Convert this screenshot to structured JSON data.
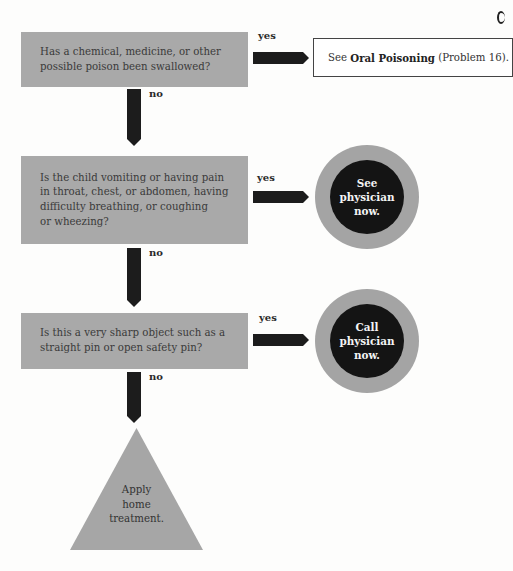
{
  "flowchart": {
    "questions": [
      {
        "lines": [
          "Has a chemical, medicine, or other",
          "possible poison been swallowed?"
        ],
        "yes_label": "yes",
        "no_label": "no"
      },
      {
        "lines": [
          "Is the child vomiting or having pain",
          "in throat, chest, or abdomen, having",
          "difficulty breathing, or coughing",
          "or wheezing?"
        ],
        "yes_label": "yes",
        "no_label": "no"
      },
      {
        "lines": [
          "Is this a very sharp object such as a",
          "straight pin or open safety pin?"
        ],
        "yes_label": "yes",
        "no_label": "no"
      }
    ],
    "outcomes": {
      "referral": {
        "prefix": "See ",
        "bold": "Oral Poisoning",
        "suffix": " (Problem 16)."
      },
      "see_physician": [
        "See",
        "physician",
        "now."
      ],
      "call_physician": [
        "Call",
        "physician",
        "now."
      ],
      "home_treatment": [
        "Apply",
        "home",
        "treatment."
      ]
    },
    "colors": {
      "question_fill": "#a9a9a9",
      "arrow": "#1c1c1c",
      "circle_ring": "#a4a4a4",
      "circle_core": "#141414",
      "triangle_fill": "#a6a6a6"
    }
  }
}
